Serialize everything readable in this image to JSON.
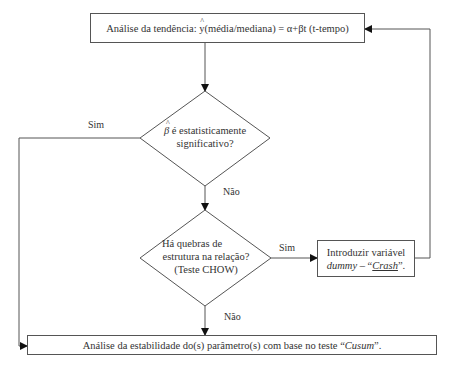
{
  "top_box": {
    "prefix": "Análise da tendência: ",
    "symbol": "y",
    "suffix": " (média/mediana) = α+βt (t-tempo)"
  },
  "decision1": {
    "symbol": "β",
    "line1_rest": " é estatisticamente",
    "line2": "significativo?",
    "yes_label": "Sim",
    "no_label": "Não"
  },
  "decision2": {
    "line1": "Há quebras de",
    "line2": "estrutura na relação?",
    "line3": "(Teste CHOW)",
    "yes_label": "Sim",
    "no_label": "Não"
  },
  "side_box": {
    "line1": "Introduzir variável",
    "dummy": "dummy",
    "dash": " – “",
    "crash": "Crash",
    "end": "”."
  },
  "bottom_box": {
    "prefix": "Análise da estabilidade do(s) parâmetro(s) com base no teste “",
    "cusum": "Cusum",
    "end": "”."
  },
  "colors": {
    "stroke": "#555555",
    "text": "#333333",
    "background": "#ffffff"
  }
}
